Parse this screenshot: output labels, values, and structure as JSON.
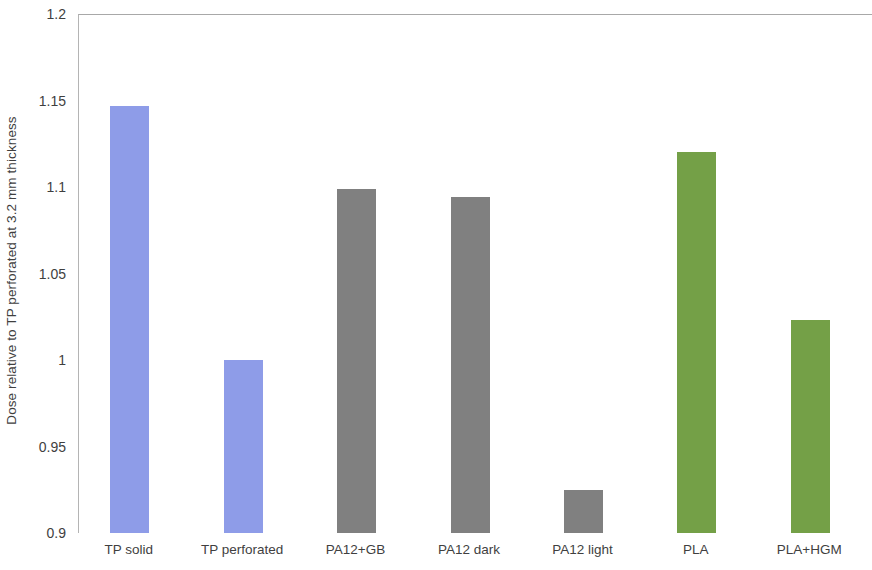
{
  "chart_data": {
    "type": "bar",
    "title": "",
    "subtitle": "",
    "xlabel": "",
    "ylabel": "Dose relative to TP perforated at 3.2 mm thickness",
    "ylim": [
      0.9,
      1.2
    ],
    "ytick_labels": [
      "1.2",
      "1.15",
      "1.1",
      "1.05",
      "1",
      "0.95",
      "0.9"
    ],
    "ytick_values": [
      1.2,
      1.15,
      1.1,
      1.05,
      1.0,
      0.95,
      0.9
    ],
    "grid": false,
    "legend": null,
    "categories": [
      "TP solid",
      "TP perforated",
      "PA12+GB",
      "PA12 dark",
      "PA12 light",
      "PLA",
      "PLA+HGM"
    ],
    "values": [
      1.147,
      1.0,
      1.099,
      1.094,
      0.925,
      1.12,
      1.023
    ],
    "bar_colors": [
      "#8e9ce8",
      "#8e9ce8",
      "#808080",
      "#808080",
      "#808080",
      "#74a047",
      "#74a047"
    ],
    "series": [
      {
        "name": "Dose relative to TP perforated at 3.2 mm thickness",
        "values": [
          1.147,
          1.0,
          1.099,
          1.094,
          0.925,
          1.12,
          1.023
        ]
      }
    ],
    "points": [
      {
        "category": "TP solid",
        "value": 1.147,
        "color": "#8e9ce8"
      },
      {
        "category": "TP perforated",
        "value": 1.0,
        "color": "#8e9ce8"
      },
      {
        "category": "PA12+GB",
        "value": 1.099,
        "color": "#808080"
      },
      {
        "category": "PA12 dark",
        "value": 1.094,
        "color": "#808080"
      },
      {
        "category": "PA12 light",
        "value": 0.925,
        "color": "#808080"
      },
      {
        "category": "PLA",
        "value": 1.12,
        "color": "#74a047"
      },
      {
        "category": "PLA+HGM",
        "value": 1.023,
        "color": "#74a047"
      }
    ],
    "colors": {
      "blue": "#8e9ce8",
      "gray": "#808080",
      "green": "#74a047",
      "axis": "#b4b4b4",
      "text": "#3f3f3f",
      "background": "#ffffff"
    }
  }
}
